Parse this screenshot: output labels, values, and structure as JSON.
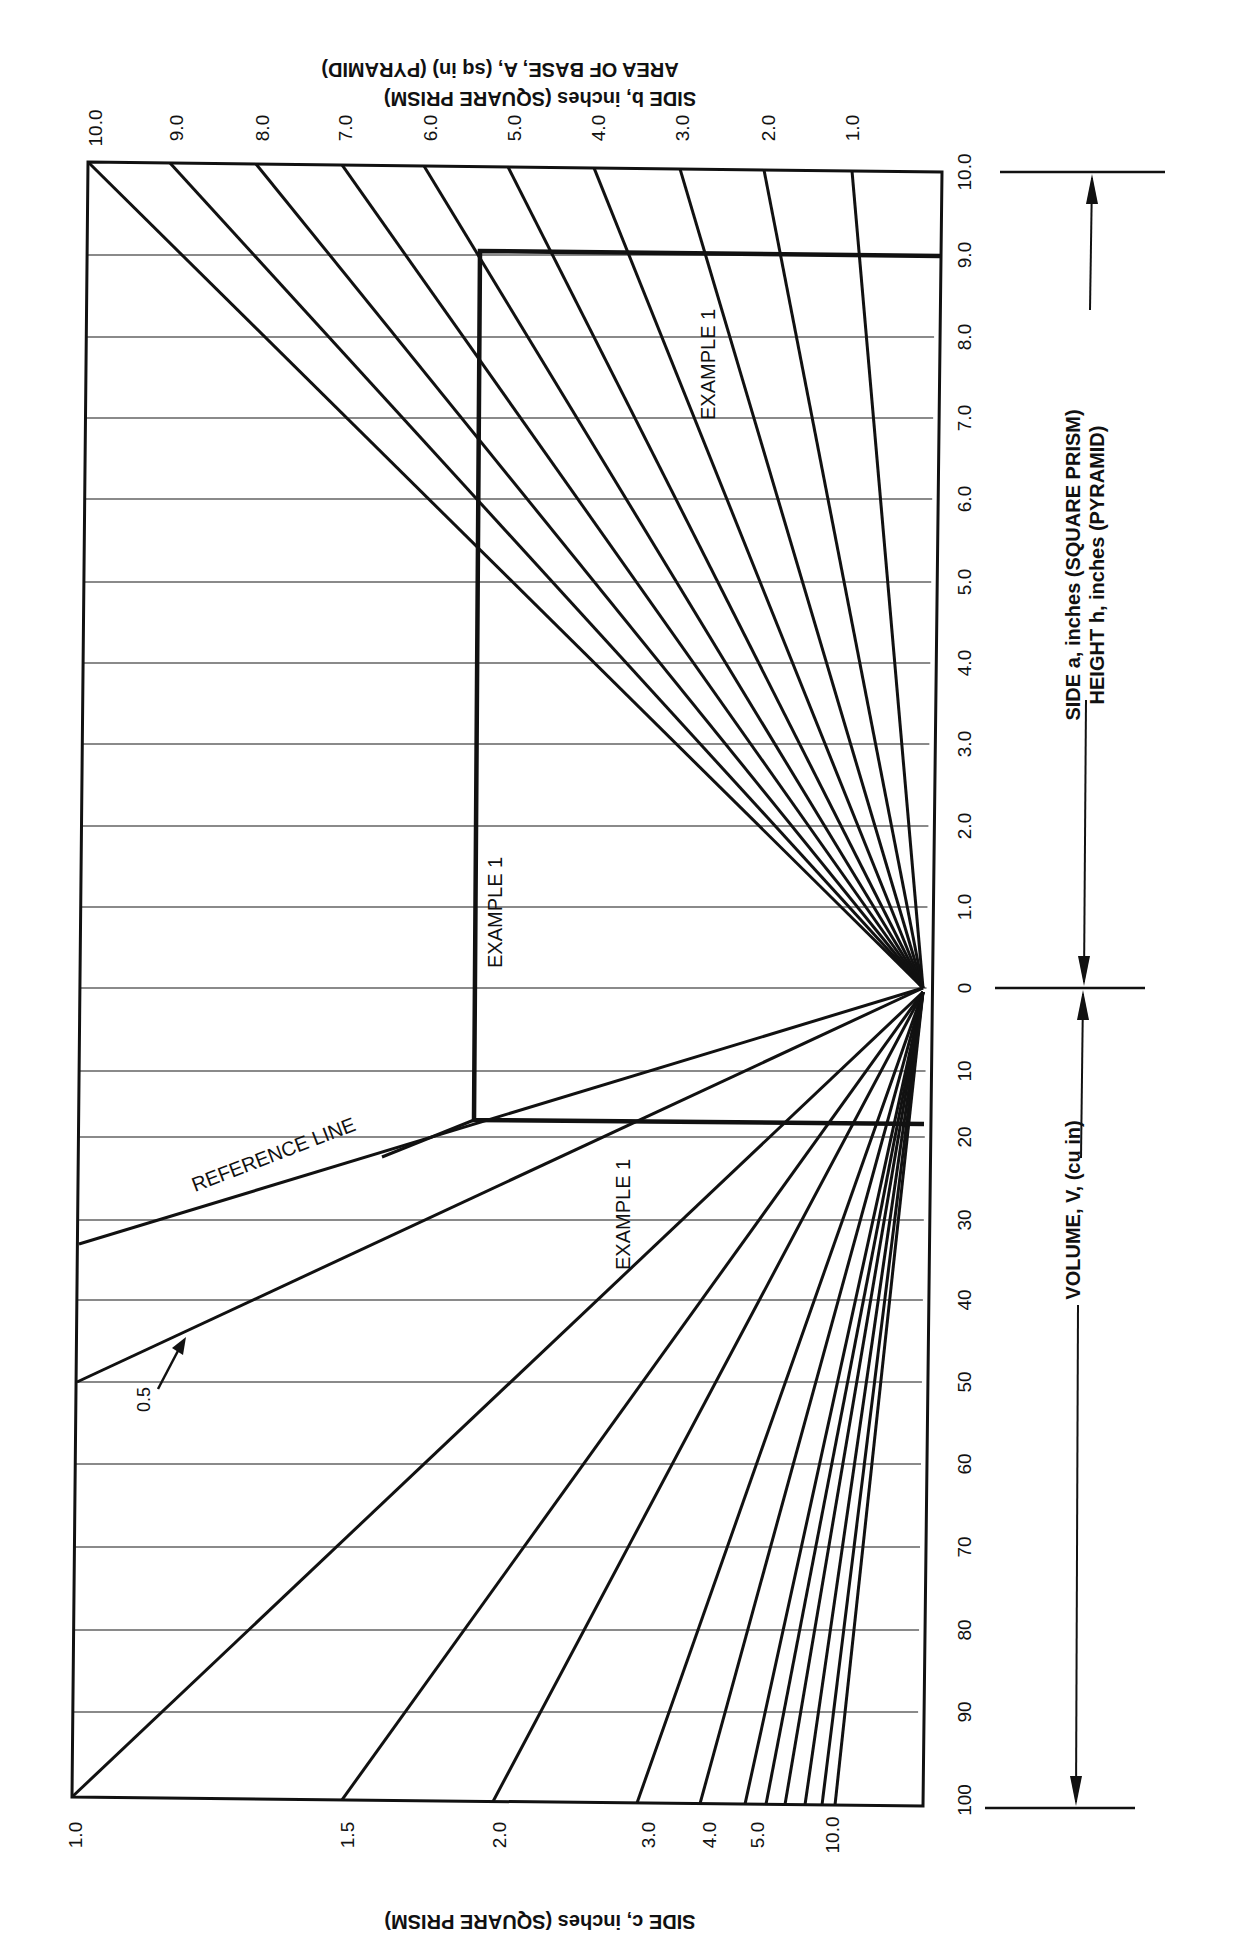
{
  "chart_data": {
    "type": "nomograph",
    "orientation_note": "Figure printed rotated 90 degrees; top and bottom axis texts are upside down",
    "axes": {
      "top": {
        "label_line1": "SIDE b, inches (SQUARE PRISM)",
        "label_line2": "AREA OF BASE, A, (sq in) (PYRAMID)",
        "ticks": [
          "10.0",
          "9.0",
          "8.0",
          "7.0",
          "6.0",
          "5.0",
          "4.0",
          "3.0",
          "2.0",
          "1.0"
        ],
        "tick_values": [
          10.0,
          9.0,
          8.0,
          7.0,
          6.0,
          5.0,
          4.0,
          3.0,
          2.0,
          1.0
        ]
      },
      "right_upper": {
        "label_line1": "SIDE a, inches (SQUARE PRISM)",
        "label_line2": "HEIGHT h, inches (PYRAMID)",
        "ticks": [
          "10.0",
          "9.0",
          "8.0",
          "7.0",
          "6.0",
          "5.0",
          "4.0",
          "3.0",
          "2.0",
          "1.0",
          "0"
        ],
        "tick_values": [
          10.0,
          9.0,
          8.0,
          7.0,
          6.0,
          5.0,
          4.0,
          3.0,
          2.0,
          1.0,
          0
        ]
      },
      "right_lower": {
        "label": "VOLUME, V, (cu in)",
        "ticks": [
          "10",
          "20",
          "30",
          "40",
          "50",
          "60",
          "70",
          "80",
          "90",
          "100"
        ],
        "tick_values": [
          10,
          20,
          30,
          40,
          50,
          60,
          70,
          80,
          90,
          100
        ]
      },
      "bottom": {
        "label": "SIDE c, inches (SQUARE PRISM)",
        "ticks": [
          "1.0",
          "1.5",
          "2.0",
          "3.0",
          "4.0",
          "5.0",
          "10.0"
        ],
        "tick_values": [
          1.0,
          1.5,
          2.0,
          3.0,
          4.0,
          5.0,
          10.0
        ]
      }
    },
    "annotations": [
      {
        "text": "REFERENCE LINE",
        "type": "line-label"
      },
      {
        "text": "EXAMPLE 1",
        "position": "upper-right, along b-line"
      },
      {
        "text": "EXAMPLE 1",
        "position": "middle, along vertical a-line"
      },
      {
        "text": "EXAMPLE 1",
        "position": "lower, below V=17 line"
      },
      {
        "text": "0.5",
        "type": "arrow-label",
        "target": "c = 0.5 line"
      }
    ],
    "example_1": {
      "side_a": 9.0,
      "side_b": 5.4,
      "volume_approx": 17
    },
    "grid": true,
    "legend": null
  }
}
